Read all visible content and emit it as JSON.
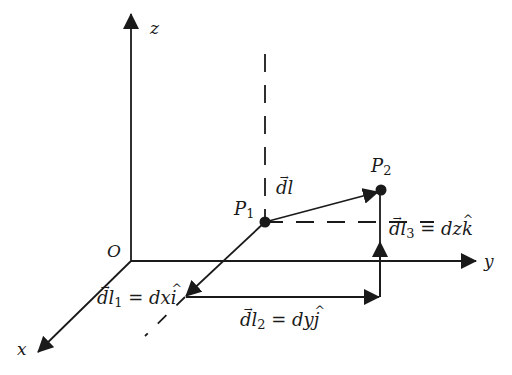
{
  "figure": {
    "axes": {
      "x": "x",
      "y": "y",
      "z": "z",
      "origin": "O"
    },
    "points": {
      "p1": "P",
      "p1_sub": "1",
      "p2": "P",
      "p2_sub": "2"
    },
    "vectors": {
      "dl": {
        "main": "dl"
      },
      "dl1": {
        "main": "dl",
        "sub": "1",
        "rhs": "= dx",
        "unit": "i"
      },
      "dl2": {
        "main": "dl",
        "sub": "2",
        "rhs": "= dy",
        "unit": "j"
      },
      "dl3": {
        "main": "dl",
        "sub": "3",
        "rhs": "= dz",
        "unit": "k"
      }
    },
    "colors": {
      "line": "#1a1a1a",
      "background": "#ffffff"
    }
  }
}
